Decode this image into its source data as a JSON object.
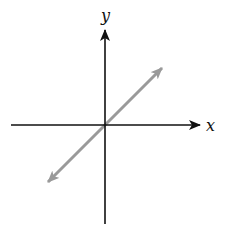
{
  "diagram": {
    "type": "coordinate-plane",
    "axes": {
      "x_label": "x",
      "y_label": "y",
      "color": "#111111"
    },
    "line": {
      "description": "straight line through the origin with positive slope, arrows at both ends",
      "slope_sign": "positive",
      "passes_through_origin": true,
      "color": "#9a9a9a"
    }
  }
}
